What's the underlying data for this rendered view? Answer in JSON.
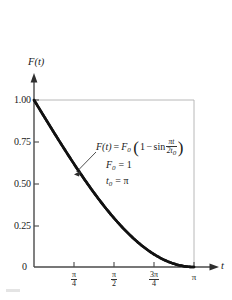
{
  "chart_data": {
    "type": "line",
    "title": "",
    "xlabel": "t",
    "ylabel": "F(t)",
    "xlim": [
      0,
      3.14159
    ],
    "ylim": [
      0,
      1.0
    ],
    "grid": false,
    "legend": "none",
    "equation": "F(t) = F_0 (1 - sin(pi*t / (2*t_0)))",
    "parameters": [
      {
        "symbol": "F",
        "subscript": "0",
        "value": "1"
      },
      {
        "symbol": "t",
        "subscript": "0",
        "value": "π"
      }
    ],
    "x": [
      0.0,
      0.1963,
      0.3927,
      0.589,
      0.7854,
      0.9817,
      1.1781,
      1.3744,
      1.5708,
      1.7671,
      1.9635,
      2.1598,
      2.3562,
      2.5525,
      2.7489,
      2.9452,
      3.1416
    ],
    "y": [
      1.0,
      0.9019,
      0.8049,
      0.7099,
      0.6173,
      0.5279,
      0.4423,
      0.3612,
      0.2929,
      0.2146,
      0.1522,
      0.0969,
      0.0761,
      0.0381,
      0.0152,
      0.0038,
      0.0
    ],
    "series": [
      {
        "name": "F(t)",
        "values": [
          1.0,
          0.9019,
          0.8049,
          0.7099,
          0.6173,
          0.5279,
          0.4423,
          0.3612,
          0.2929,
          0.2146,
          0.1522,
          0.0969,
          0.0761,
          0.0381,
          0.0152,
          0.0038,
          0.0
        ]
      }
    ],
    "y_ticks": [
      {
        "value": 0,
        "label": "0"
      },
      {
        "value": 0.25,
        "label": "0.25"
      },
      {
        "value": 0.5,
        "label": "0.50"
      },
      {
        "value": 0.75,
        "label": "0.75"
      },
      {
        "value": 1.0,
        "label": "1.00"
      }
    ],
    "x_ticks": [
      {
        "value": 0.7854,
        "numerator": "π",
        "denominator": "4"
      },
      {
        "value": 1.5708,
        "numerator": "π",
        "denominator": "2"
      },
      {
        "value": 2.3562,
        "numerator": "3π",
        "denominator": "4"
      },
      {
        "value": 3.1416,
        "label": "π"
      }
    ],
    "colors": {
      "curve": "#111111",
      "axis": "#4a4a4a",
      "frame": "#b0b0b0",
      "background": "#ffffff"
    }
  },
  "axes": {
    "y_label": "F(t)",
    "x_label": "t"
  },
  "y_tick_labels": {
    "t100": "1.00",
    "t075": "0.75",
    "t050": "0.50",
    "t025": "0.25",
    "t000": "0"
  },
  "x_tick_labels": {
    "pi4_num": "π",
    "pi4_den": "4",
    "pi2_num": "π",
    "pi2_den": "2",
    "pi34_num": "3π",
    "pi34_den": "4",
    "pi": "π"
  },
  "equation": {
    "lhs": "F(t)",
    "equals": "=",
    "f_sub_zero": "F",
    "f_sub_zero_sub": "0",
    "open_paren": "(",
    "one": "1",
    "minus": "−",
    "sin": "sin",
    "frac_num": "πt",
    "frac_den_2": "2t",
    "frac_den_sub": "0",
    "close_paren": ")",
    "param_f0_symbol": "F",
    "param_f0_sub": "0",
    "param_f0_eq": "= 1",
    "param_t0_symbol": "t",
    "param_t0_sub": "0",
    "param_t0_eq": "= π"
  }
}
